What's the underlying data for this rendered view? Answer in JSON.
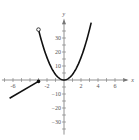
{
  "chart_data": {
    "type": "line",
    "title": "",
    "xlabel": "x",
    "ylabel": "y",
    "xlim": [
      -7,
      7.5
    ],
    "ylim": [
      -38,
      40
    ],
    "x_ticks": [
      -6,
      -2,
      2,
      4,
      6
    ],
    "x_tick_labels": [
      "-6",
      "-2",
      "2",
      "4",
      "6"
    ],
    "y_ticks": [
      30,
      20,
      10,
      -10,
      -20,
      -30
    ],
    "y_tick_labels": [
      "30",
      "20",
      "10",
      "−10",
      "−20",
      "−30"
    ],
    "grid": false,
    "series": [
      {
        "name": "linear piece",
        "description": "line segment for x <= -3, closed endpoint at x = -3",
        "points": [
          [
            -6.4,
            -13
          ],
          [
            -3,
            -1
          ]
        ],
        "endpoint": {
          "x": -3,
          "y": -1,
          "style": "closed"
        }
      },
      {
        "name": "quadratic piece",
        "description": "parabola y = 4x^2 for -3 < x <= 3, open endpoint at x = -3",
        "formula": "4x^2",
        "x_range": [
          -3,
          3.2
        ],
        "endpoint": {
          "x": -3,
          "y": 36,
          "style": "open"
        }
      }
    ]
  },
  "labels": {
    "x_axis": "x",
    "y_axis": "y"
  }
}
